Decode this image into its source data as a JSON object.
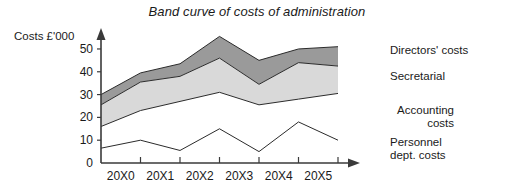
{
  "chart_data": {
    "type": "area",
    "title": "Band curve of costs of administration",
    "ylabel": "Costs £'000",
    "xlabel": "",
    "categories": [
      "20X0",
      "20X1",
      "20X2",
      "20X3",
      "20X4",
      "20X5"
    ],
    "x_positions": [
      0,
      1,
      2,
      3,
      4,
      5,
      6
    ],
    "ylim": [
      0,
      57
    ],
    "yticks": [
      0,
      10,
      20,
      30,
      40,
      50
    ],
    "ytick_labels": [
      "0",
      "10",
      "20",
      "30",
      "40",
      "50"
    ],
    "grid": false,
    "legend_position": "right",
    "stacked": true,
    "series": [
      {
        "name": "Personnel dept. costs",
        "fill": "#ffffff",
        "cumulative_top": [
          6.5,
          10.0,
          5.5,
          15.0,
          5.0,
          18.0,
          10.0
        ]
      },
      {
        "name": "Accounting costs",
        "fill": "#ffffff",
        "cumulative_top": [
          16.0,
          23.0,
          27.0,
          31.0,
          25.5,
          28.0,
          30.5
        ]
      },
      {
        "name": "Secretarial",
        "fill": "#d9d9d9",
        "cumulative_top": [
          25.5,
          35.5,
          38.0,
          46.0,
          34.5,
          44.0,
          42.5
        ]
      },
      {
        "name": "Directors' costs",
        "fill": "#9a9a9a",
        "cumulative_top": [
          30.0,
          39.5,
          43.5,
          55.5,
          45.0,
          50.0,
          51.0
        ]
      }
    ]
  },
  "legend": {
    "directors": "Directors' costs",
    "secretarial": "Secretarial",
    "accounting": "Accounting\ncosts",
    "personnel": "Personnel\ndept. costs"
  },
  "colors": {
    "band_directors": "#9a9a9a",
    "band_secretarial": "#d9d9d9",
    "band_accounting": "#ffffff",
    "band_personnel": "#ffffff",
    "axis": "#3a3a3a",
    "line": "#2b2b2b",
    "text": "#1a1a1a"
  }
}
